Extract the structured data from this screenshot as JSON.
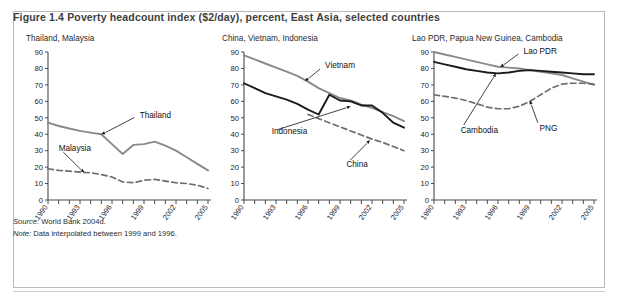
{
  "figure": {
    "title": "Figure 1.4  Poverty headcount index ($2/day), percent, East Asia, selected countries",
    "source": "Source: World Bank 2004d.",
    "source_lead": "Source:",
    "source_rest": " World Bank 2004d.",
    "note_lead": "Note:",
    "note_rest": " Data interpolated between 1999 and 1996.",
    "colors": {
      "solid_black": "#1a1a1a",
      "solid_gray": "#8a8a8a",
      "dashed_gray": "#6e6e6e",
      "axis": "#4a4a4a",
      "title": "#3e3e3e",
      "frame": "#b9b9b9"
    }
  },
  "chart_data": [
    {
      "type": "line",
      "title": "Thailand, Malaysia",
      "xlabel": "",
      "ylabel": "",
      "ylim": [
        0,
        90
      ],
      "ytick_step": 10,
      "xlim": [
        1990,
        2005
      ],
      "xticks": [
        1990,
        1991,
        1992,
        1993,
        1994,
        1995,
        1996,
        1997,
        1998,
        1999,
        2000,
        2001,
        2002,
        2003,
        2004,
        2005
      ],
      "xtick_labels": [
        "1990",
        "",
        "",
        "1993",
        "",
        "",
        "1996",
        "",
        "",
        "1999",
        "",
        "",
        "2002",
        "",
        "",
        "2005"
      ],
      "grid": false,
      "legend": "annotations",
      "x": [
        1990,
        1991,
        1992,
        1993,
        1994,
        1995,
        1996,
        1997,
        1998,
        1999,
        2000,
        2001,
        2002,
        2003,
        2004,
        2005
      ],
      "series": [
        {
          "name": "Thailand",
          "style": "solid",
          "color": "#8a8a8a",
          "values": [
            47,
            45,
            43.5,
            42,
            41,
            40,
            34,
            28,
            33.5,
            34,
            35.5,
            33,
            30,
            26,
            22,
            18
          ],
          "annotation": {
            "label": "Thailand",
            "point_year": 1995,
            "point_value": 40,
            "text_year": 1998.6,
            "text_value": 50
          }
        },
        {
          "name": "Malaysia",
          "style": "dashed",
          "color": "#6e6e6e",
          "values": [
            19,
            18,
            17.5,
            17,
            16.5,
            15.5,
            14,
            11,
            10.5,
            12,
            12.5,
            11.5,
            10.5,
            10,
            9,
            7
          ],
          "annotation": {
            "label": "Malaysia",
            "point_year": 1993.4,
            "point_value": 16.8,
            "text_year": 1991.0,
            "text_value": 30
          }
        }
      ]
    },
    {
      "type": "line",
      "title": "China, Vietnam, Indonesia",
      "xlabel": "",
      "ylabel": "",
      "ylim": [
        0,
        90
      ],
      "ytick_step": 10,
      "xlim": [
        1990,
        2005
      ],
      "xticks": [
        1990,
        1991,
        1992,
        1993,
        1994,
        1995,
        1996,
        1997,
        1998,
        1999,
        2000,
        2001,
        2002,
        2003,
        2004,
        2005
      ],
      "xtick_labels": [
        "1990",
        "",
        "",
        "1993",
        "",
        "",
        "1996",
        "",
        "",
        "1999",
        "",
        "",
        "2002",
        "",
        "",
        "2005"
      ],
      "grid": false,
      "legend": "annotations",
      "x": [
        1990,
        1991,
        1992,
        1993,
        1994,
        1995,
        1996,
        1997,
        1998,
        1999,
        2000,
        2001,
        2002,
        2003,
        2004,
        2005
      ],
      "series": [
        {
          "name": "Vietnam",
          "style": "solid",
          "color": "#8a8a8a",
          "values": [
            88,
            85.5,
            83,
            80.5,
            78,
            75.5,
            72,
            68,
            65,
            62,
            60.5,
            58,
            56,
            53.5,
            51,
            48
          ],
          "annotation": {
            "label": "Vietnam",
            "point_year": 1995.7,
            "point_value": 72.5,
            "text_year": 1997.6,
            "text_value": 80
          }
        },
        {
          "name": "Indonesia",
          "style": "solid",
          "color": "#1a1a1a",
          "values": [
            71,
            68,
            65,
            63,
            61,
            58.5,
            55,
            52,
            64,
            60.5,
            60,
            57.5,
            57.5,
            53,
            47,
            44
          ],
          "annotation": {
            "label": "Indonesia",
            "point_year": 2000.0,
            "point_value": 57,
            "text_year": 1992.6,
            "text_value": 40
          }
        },
        {
          "name": "China",
          "style": "dashed",
          "color": "#6e6e6e",
          "values": [
            null,
            null,
            null,
            null,
            null,
            null,
            52,
            49.5,
            47,
            44.5,
            42,
            39.5,
            37,
            35,
            32.5,
            30
          ],
          "annotation": {
            "label": "China",
            "point_year": 2001.8,
            "point_value": 36.5,
            "text_year": 1999.6,
            "text_value": 20
          }
        }
      ]
    },
    {
      "type": "line",
      "title": "Lao PDR, Papua New Guinea, Cambodia",
      "xlabel": "",
      "ylabel": "",
      "ylim": [
        0,
        90
      ],
      "ytick_step": 10,
      "xlim": [
        1990,
        2005
      ],
      "xticks": [
        1990,
        1991,
        1992,
        1993,
        1994,
        1995,
        1996,
        1997,
        1998,
        1999,
        2000,
        2001,
        2002,
        2003,
        2004,
        2005
      ],
      "xtick_labels": [
        "1990",
        "",
        "",
        "1993",
        "",
        "",
        "1996",
        "",
        "",
        "1999",
        "",
        "",
        "2002",
        "",
        "",
        "2005"
      ],
      "grid": false,
      "legend": "annotations",
      "x": [
        1990,
        1991,
        1992,
        1993,
        1994,
        1995,
        1996,
        1997,
        1998,
        1999,
        2000,
        2001,
        2002,
        2003,
        2004,
        2005
      ],
      "series": [
        {
          "name": "Lao PDR",
          "style": "solid",
          "color": "#8a8a8a",
          "values": [
            90,
            88.5,
            87,
            85.5,
            84,
            82.5,
            81,
            80.5,
            80,
            79,
            78,
            77,
            76,
            74,
            72,
            70
          ],
          "annotation": {
            "label": "Lao PDR",
            "point_year": 1996.2,
            "point_value": 81,
            "text_year": 1998.4,
            "text_value": 89
          }
        },
        {
          "name": "Cambodia",
          "style": "solid",
          "color": "#1a1a1a",
          "values": [
            84,
            82.5,
            81,
            79.5,
            78.5,
            77.5,
            77,
            77.5,
            78.5,
            79,
            78.5,
            78,
            77.5,
            77,
            76.5,
            76.5
          ],
          "annotation": {
            "label": "Cambodia",
            "point_year": 1995.8,
            "point_value": 77,
            "text_year": 1992.5,
            "text_value": 41
          }
        },
        {
          "name": "PNG",
          "style": "dashed",
          "color": "#6e6e6e",
          "values": [
            64,
            63,
            62,
            60.5,
            58.5,
            56.5,
            55.5,
            55.5,
            57,
            60,
            64,
            68,
            70.5,
            71,
            71,
            70.5
          ],
          "annotation": {
            "label": "PNG",
            "point_year": 1999.0,
            "point_value": 60.5,
            "text_year": 1999.9,
            "text_value": 42
          }
        }
      ]
    }
  ]
}
